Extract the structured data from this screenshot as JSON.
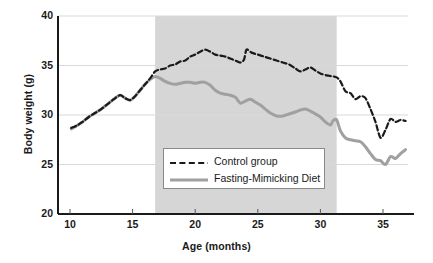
{
  "chart_data": {
    "type": "line",
    "title": "",
    "xlabel": "Age (months)",
    "ylabel": "Body weight (g)",
    "xlim": [
      9.6,
      37.0
    ],
    "ylim": [
      20,
      40
    ],
    "xticks": [
      10,
      15,
      20,
      25,
      30,
      35
    ],
    "yticks": [
      20,
      25,
      30,
      35,
      40
    ],
    "grid": "horizontal",
    "legend_position": "inside-center-lower",
    "shaded_region": {
      "label": "",
      "x_start": 16.8,
      "x_end": 31.3,
      "color": "#d6d6d6"
    },
    "series": [
      {
        "name": "Control group",
        "style": "dashed",
        "color": "#1a1a1a",
        "x": [
          10.1,
          10.5,
          11.0,
          11.5,
          12.0,
          12.5,
          13.0,
          13.5,
          14.0,
          14.4,
          14.8,
          15.2,
          15.6,
          16.0,
          16.4,
          16.8,
          17.2,
          17.6,
          18.0,
          18.4,
          18.8,
          19.2,
          19.6,
          20.0,
          20.4,
          20.8,
          21.2,
          21.6,
          22.0,
          22.4,
          22.8,
          23.2,
          23.6,
          23.9,
          24.1,
          24.5,
          25.0,
          25.5,
          26.0,
          26.5,
          27.0,
          27.5,
          28.0,
          28.4,
          28.8,
          29.2,
          29.6,
          30.0,
          30.5,
          31.0,
          31.3,
          31.6,
          32.0,
          32.4,
          32.8,
          33.2,
          33.6,
          34.0,
          34.4,
          34.8,
          35.2,
          35.6,
          36.0,
          36.4,
          36.8
        ],
        "y": [
          28.7,
          28.9,
          29.3,
          29.8,
          30.2,
          30.6,
          31.1,
          31.6,
          32.0,
          31.7,
          31.5,
          31.9,
          32.5,
          33.1,
          33.7,
          34.4,
          34.6,
          34.7,
          35.0,
          35.1,
          35.4,
          35.5,
          35.9,
          36.1,
          36.4,
          36.6,
          36.4,
          36.1,
          36.0,
          35.9,
          35.7,
          35.5,
          35.3,
          35.6,
          36.6,
          36.3,
          36.1,
          35.9,
          35.7,
          35.5,
          35.3,
          35.1,
          34.7,
          34.4,
          34.6,
          34.8,
          34.5,
          34.2,
          34.0,
          33.9,
          33.8,
          33.4,
          32.4,
          32.2,
          31.6,
          31.9,
          31.7,
          30.6,
          29.3,
          27.7,
          28.5,
          29.6,
          29.3,
          29.5,
          29.4
        ]
      },
      {
        "name": "Fasting-Mimicking Diet",
        "style": "solid",
        "color": "#a0a0a0",
        "x": [
          10.1,
          10.5,
          11.0,
          11.5,
          12.0,
          12.5,
          13.0,
          13.5,
          14.0,
          14.4,
          14.8,
          15.2,
          15.6,
          16.0,
          16.4,
          16.8,
          17.2,
          17.6,
          18.0,
          18.4,
          18.8,
          19.2,
          19.6,
          20.0,
          20.4,
          20.8,
          21.2,
          21.6,
          22.0,
          22.4,
          22.8,
          23.2,
          23.6,
          24.0,
          24.4,
          24.8,
          25.2,
          25.6,
          26.0,
          26.5,
          27.0,
          27.5,
          28.0,
          28.4,
          28.8,
          29.2,
          29.6,
          30.0,
          30.4,
          30.8,
          31.0,
          31.3,
          31.6,
          32.0,
          32.4,
          32.8,
          33.2,
          33.6,
          34.0,
          34.4,
          34.8,
          35.2,
          35.6,
          36.0,
          36.4,
          36.8
        ],
        "y": [
          28.6,
          28.9,
          29.3,
          29.8,
          30.2,
          30.6,
          31.1,
          31.6,
          32.0,
          31.7,
          31.5,
          31.9,
          32.5,
          33.1,
          33.6,
          33.9,
          33.7,
          33.4,
          33.2,
          33.1,
          33.2,
          33.3,
          33.3,
          33.2,
          33.3,
          33.3,
          33.0,
          32.5,
          32.2,
          32.1,
          32.0,
          31.8,
          31.2,
          31.4,
          31.6,
          31.3,
          31.0,
          30.6,
          30.2,
          29.9,
          29.9,
          30.1,
          30.3,
          30.5,
          30.6,
          30.4,
          30.1,
          29.8,
          29.3,
          29.0,
          29.4,
          29.5,
          28.4,
          27.7,
          27.5,
          27.4,
          27.3,
          26.8,
          26.1,
          25.5,
          25.4,
          25.0,
          25.8,
          25.6,
          26.1,
          26.5
        ]
      }
    ]
  },
  "axes": {
    "y_title": "Body weight (g)",
    "x_title": "Age (months)",
    "y_tick_labels": [
      "40",
      "35",
      "30",
      "25",
      "20"
    ],
    "x_tick_labels": [
      "10",
      "15",
      "20",
      "25",
      "30",
      "35"
    ]
  },
  "legend": {
    "entries": [
      {
        "label": "Control group",
        "style": "dashed",
        "color": "#1a1a1a"
      },
      {
        "label": "Fasting-Mimicking Diet",
        "style": "solid",
        "color": "#a0a0a0"
      }
    ]
  },
  "colors": {
    "control": "#1a1a1a",
    "fmd": "#a0a0a0",
    "shade": "#d6d6d6",
    "grid": "#d9d9d9",
    "axis": "#1a1a1a"
  }
}
